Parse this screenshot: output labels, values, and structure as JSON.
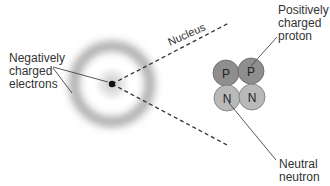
{
  "diagram": {
    "labels": {
      "electrons": "Negatively\ncharged\nelectrons",
      "nucleus": "Nucleus",
      "proton": "Positively\ncharged\nproton",
      "neutron": "Neutral\nneutron"
    },
    "particles": [
      {
        "symbol": "P",
        "type": "proton"
      },
      {
        "symbol": "P",
        "type": "proton"
      },
      {
        "symbol": "N",
        "type": "neutron"
      },
      {
        "symbol": "N",
        "type": "neutron"
      }
    ],
    "colors": {
      "proton": "#8e8e8e",
      "neutron": "#b9b9b9",
      "electron_cloud": "#9a9a9a",
      "lines": "#333333"
    }
  }
}
